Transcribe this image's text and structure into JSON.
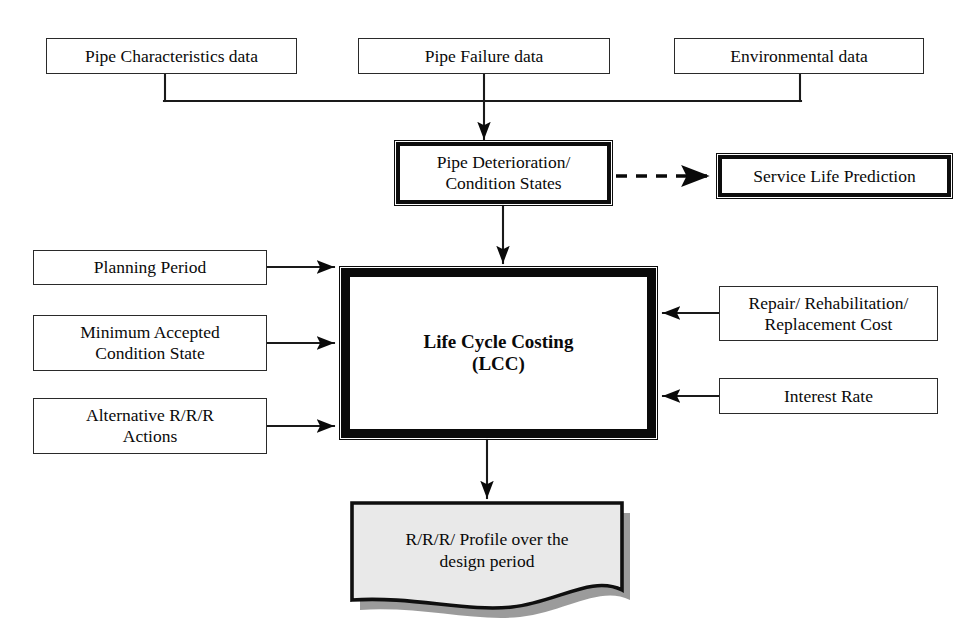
{
  "diagram": {
    "colors": {
      "stroke": "#0a0a0a",
      "thin_stroke": "#2a2a2a",
      "background": "#ffffff",
      "document_fill": "#e9e9e9",
      "document_shadow": "#7a7a7a"
    },
    "nodes": {
      "pipe_characteristics": {
        "label": "Pipe Characteristics  data",
        "style": "thin",
        "x": 46,
        "y": 38,
        "w": 251,
        "h": 36
      },
      "pipe_failure": {
        "label": "Pipe Failure data",
        "style": "thin",
        "x": 358,
        "y": 38,
        "w": 252,
        "h": 36
      },
      "environmental": {
        "label": "Environmental data",
        "style": "thin",
        "x": 674,
        "y": 38,
        "w": 250,
        "h": 36
      },
      "pipe_deterioration": {
        "label": "Pipe Deterioration/\nCondition States",
        "style": "heavy",
        "x": 396,
        "y": 142,
        "w": 215,
        "h": 62
      },
      "service_life": {
        "label": "Service Life Prediction",
        "style": "heavy",
        "x": 718,
        "y": 155,
        "w": 233,
        "h": 42
      },
      "planning_period": {
        "label": "Planning Period",
        "style": "thin",
        "x": 33,
        "y": 250,
        "w": 234,
        "h": 35
      },
      "minimum_condition": {
        "label": "Minimum Accepted\nCondition State",
        "style": "thin",
        "x": 33,
        "y": 315,
        "w": 234,
        "h": 56
      },
      "alternative_actions": {
        "label": "Alternative R/R/R\nActions",
        "style": "thin",
        "x": 33,
        "y": 398,
        "w": 234,
        "h": 56
      },
      "life_cycle_costing": {
        "label": "Life Cycle Costing\n(LCC)",
        "style": "verythick",
        "x": 341,
        "y": 268,
        "w": 315,
        "h": 170
      },
      "repair_cost": {
        "label": "Repair/ Rehabilitation/\nReplacement Cost",
        "style": "thin",
        "x": 719,
        "y": 286,
        "w": 219,
        "h": 55
      },
      "interest_rate": {
        "label": "Interest Rate",
        "style": "thin",
        "x": 719,
        "y": 378,
        "w": 219,
        "h": 36
      },
      "output_profile": {
        "label": "R/R/R/ Profile over the\ndesign period",
        "style": "document",
        "x": 352,
        "y": 503,
        "w": 270,
        "h": 110
      }
    },
    "connectors": [
      {
        "name": "pipe-characteristics-to-bus",
        "type": "solid",
        "arrow": false
      },
      {
        "name": "pipe-failure-to-bus",
        "type": "solid",
        "arrow": false
      },
      {
        "name": "environmental-to-bus",
        "type": "solid",
        "arrow": false
      },
      {
        "name": "bus-to-pipe-deterioration",
        "type": "solid",
        "arrow": true
      },
      {
        "name": "pipe-deterioration-to-service-life",
        "type": "dashed",
        "arrow": true
      },
      {
        "name": "pipe-deterioration-to-lcc",
        "type": "solid",
        "arrow": true
      },
      {
        "name": "planning-period-to-lcc",
        "type": "solid",
        "arrow": true
      },
      {
        "name": "minimum-condition-to-lcc",
        "type": "solid",
        "arrow": true
      },
      {
        "name": "alternative-actions-to-lcc",
        "type": "solid",
        "arrow": true
      },
      {
        "name": "repair-cost-to-lcc",
        "type": "solid",
        "arrow": true
      },
      {
        "name": "interest-rate-to-lcc",
        "type": "solid",
        "arrow": true
      },
      {
        "name": "lcc-to-output-profile",
        "type": "solid",
        "arrow": true
      }
    ]
  }
}
